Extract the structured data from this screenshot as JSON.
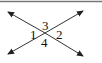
{
  "diagram": {
    "type": "intersecting-lines-angles",
    "angle_labels": {
      "top": "3",
      "left": "1",
      "right": "2",
      "bottom": "4"
    },
    "line_color": "#333333",
    "border_color": "#777777"
  }
}
